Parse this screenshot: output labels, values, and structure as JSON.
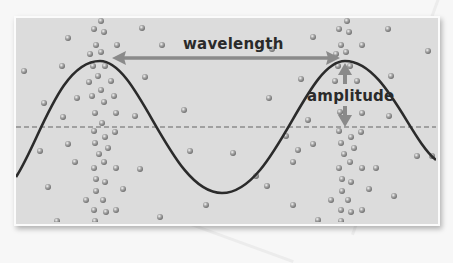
{
  "diagram": {
    "type": "transverse-wave",
    "labels": {
      "wavelength": "wavelength",
      "amplitude": "amplitude"
    },
    "colors": {
      "panel_background": "#dcdcdc",
      "wave_line": "#2b2b2b",
      "arrow": "#8a8a8a",
      "particle": "#9a9a9a",
      "equilibrium_line": "#8c8c8c"
    },
    "wave": {
      "crests_x": [
        100,
        345
      ],
      "trough_x": 222,
      "crest_y": 61,
      "trough_y": 193,
      "equilibrium_y": 127
    },
    "wavelength_arrow": {
      "x1": 113,
      "x2": 338,
      "y": 58
    },
    "amplitude_arrow": {
      "x": 345,
      "y1": 64,
      "y2": 126
    }
  }
}
